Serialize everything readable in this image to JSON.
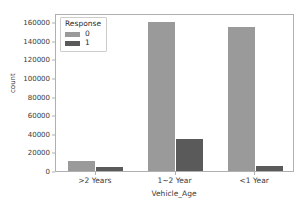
{
  "chart_data": {
    "type": "bar",
    "title": "",
    "xlabel": "Vehicle_Age",
    "ylabel": "count",
    "categories": [
      ">2 Years",
      "1~2 Year",
      "<1 Year"
    ],
    "series": [
      {
        "name": "0",
        "color": "#9a9a9a",
        "values": [
          11000,
          160000,
          155000
        ]
      },
      {
        "name": "1",
        "color": "#5a5a5a",
        "values": [
          4000,
          34000,
          5500
        ]
      }
    ],
    "legend": {
      "title": "Response",
      "position": "upper left",
      "entries": [
        {
          "label": "0",
          "color": "#9a9a9a"
        },
        {
          "label": "1",
          "color": "#5a5a5a"
        }
      ]
    },
    "ylim": [
      0,
      170000
    ],
    "yticks": [
      0,
      20000,
      40000,
      60000,
      80000,
      100000,
      120000,
      140000,
      160000
    ],
    "ytick_labels": [
      "0",
      "20000",
      "40000",
      "60000",
      "80000",
      "100000",
      "120000",
      "140000",
      "160000"
    ],
    "grid": false,
    "orientation": "vertical"
  }
}
